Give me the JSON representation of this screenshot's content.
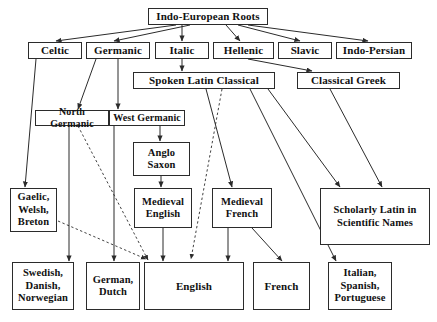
{
  "diagram": {
    "type": "flow-tree",
    "colors": {
      "stroke": "#2b2b2b",
      "text": "#111111",
      "background": "#ffffff"
    },
    "nodes": [
      {
        "id": "indo_european_roots",
        "label": "Indo-European Roots",
        "x": 148,
        "y": 8,
        "w": 120,
        "h": 17,
        "font": "f11"
      },
      {
        "id": "celtic",
        "label": "Celtic",
        "x": 28,
        "y": 42,
        "w": 54,
        "h": 17,
        "font": "f11"
      },
      {
        "id": "germanic",
        "label": "Germanic",
        "x": 86,
        "y": 42,
        "w": 64,
        "h": 17,
        "font": "f11"
      },
      {
        "id": "italic",
        "label": "Italic",
        "x": 155,
        "y": 42,
        "w": 54,
        "h": 17,
        "font": "f11"
      },
      {
        "id": "hellenic",
        "label": "Hellenic",
        "x": 213,
        "y": 42,
        "w": 61,
        "h": 17,
        "font": "f11"
      },
      {
        "id": "slavic",
        "label": "Slavic",
        "x": 278,
        "y": 42,
        "w": 54,
        "h": 17,
        "font": "f11"
      },
      {
        "id": "indo_persian",
        "label": "Indo-Persian",
        "x": 336,
        "y": 42,
        "w": 76,
        "h": 17,
        "font": "f11"
      },
      {
        "id": "spoken_latin",
        "label": "Spoken Latin Classical",
        "x": 133,
        "y": 72,
        "w": 142,
        "h": 17,
        "font": "f11"
      },
      {
        "id": "classical_greek",
        "label": "Classical Greek",
        "x": 297,
        "y": 72,
        "w": 103,
        "h": 17,
        "font": "f11"
      },
      {
        "id": "north_germanic",
        "label": "North Germanic",
        "x": 35,
        "y": 110,
        "w": 74,
        "h": 16,
        "font": "f10"
      },
      {
        "id": "west_germanic",
        "label": "West Germanic",
        "x": 109,
        "y": 110,
        "w": 76,
        "h": 16,
        "font": "f10"
      },
      {
        "id": "anglo_saxon",
        "label": "Anglo\nSaxon",
        "x": 133,
        "y": 142,
        "w": 57,
        "h": 34,
        "font": "f105"
      },
      {
        "id": "gaelic_welsh_breton",
        "label": "Gaelic,\nWelsh,\nBreton",
        "x": 10,
        "y": 188,
        "w": 47,
        "h": 44,
        "font": "f105"
      },
      {
        "id": "medieval_english",
        "label": "Medieval\nEnglish",
        "x": 134,
        "y": 188,
        "w": 58,
        "h": 40,
        "font": "f105"
      },
      {
        "id": "medieval_french",
        "label": "Medieval\nFrench",
        "x": 212,
        "y": 188,
        "w": 60,
        "h": 40,
        "font": "f105"
      },
      {
        "id": "scholarly_latin",
        "label": "Scholarly Latin in\nScientific Names",
        "x": 320,
        "y": 188,
        "w": 110,
        "h": 57,
        "font": "f105",
        "thick": true
      },
      {
        "id": "swedish_danish_norwegian",
        "label": "Swedish,\nDanish,\nNorwegian",
        "x": 12,
        "y": 262,
        "w": 62,
        "h": 48,
        "font": "f105"
      },
      {
        "id": "german_dutch",
        "label": "German,\nDutch",
        "x": 86,
        "y": 262,
        "w": 54,
        "h": 48,
        "font": "f105"
      },
      {
        "id": "english",
        "label": "English",
        "x": 144,
        "y": 262,
        "w": 100,
        "h": 48,
        "font": "f11"
      },
      {
        "id": "french",
        "label": "French",
        "x": 253,
        "y": 262,
        "w": 57,
        "h": 48,
        "font": "f11"
      },
      {
        "id": "italian_spanish_portuguese",
        "label": "Italian,\nSpanish,\nPortuguese",
        "x": 328,
        "y": 262,
        "w": 64,
        "h": 48,
        "font": "f105"
      }
    ],
    "edges": [
      {
        "from": "indo_european_roots",
        "to": "celtic",
        "style": "solid",
        "x1": 176,
        "y1": 25,
        "x2": 56,
        "y2": 41
      },
      {
        "from": "indo_european_roots",
        "to": "germanic",
        "style": "solid",
        "x1": 190,
        "y1": 25,
        "x2": 114,
        "y2": 41
      },
      {
        "from": "indo_european_roots",
        "to": "italic",
        "style": "solid",
        "x1": 182,
        "y1": 25,
        "x2": 182,
        "y2": 41
      },
      {
        "from": "indo_european_roots",
        "to": "hellenic",
        "style": "solid",
        "x1": 226,
        "y1": 25,
        "x2": 240,
        "y2": 41
      },
      {
        "from": "indo_european_roots",
        "to": "slavic",
        "style": "solid",
        "x1": 238,
        "y1": 25,
        "x2": 300,
        "y2": 41
      },
      {
        "from": "indo_european_roots",
        "to": "indo_persian",
        "style": "solid",
        "x1": 248,
        "y1": 25,
        "x2": 368,
        "y2": 41
      },
      {
        "from": "italic",
        "to": "spoken_latin",
        "style": "solid",
        "x1": 182,
        "y1": 59,
        "x2": 182,
        "y2": 71
      },
      {
        "from": "hellenic",
        "to": "classical_greek",
        "style": "solid",
        "x1": 248,
        "y1": 59,
        "x2": 312,
        "y2": 71
      },
      {
        "from": "celtic",
        "to": "gaelic_welsh_breton",
        "style": "solid",
        "x1": 36,
        "y1": 59,
        "x2": 25,
        "y2": 187
      },
      {
        "from": "germanic",
        "to": "north_germanic",
        "style": "solid",
        "x1": 96,
        "y1": 59,
        "x2": 78,
        "y2": 109
      },
      {
        "from": "germanic",
        "to": "west_germanic",
        "style": "solid",
        "x1": 118,
        "y1": 59,
        "x2": 118,
        "y2": 109
      },
      {
        "from": "north_germanic",
        "to": "swedish_danish_norwegian",
        "style": "solid",
        "x1": 69,
        "y1": 126,
        "x2": 69,
        "y2": 261
      },
      {
        "from": "north_germanic",
        "to": "english",
        "style": "dashed",
        "x1": 78,
        "y1": 126,
        "x2": 148,
        "y2": 260
      },
      {
        "from": "west_germanic",
        "to": "anglo_saxon",
        "style": "solid",
        "x1": 160,
        "y1": 126,
        "x2": 160,
        "y2": 141
      },
      {
        "from": "west_germanic",
        "to": "german_dutch",
        "style": "solid",
        "x1": 114,
        "y1": 126,
        "x2": 114,
        "y2": 261
      },
      {
        "from": "anglo_saxon",
        "to": "medieval_english",
        "style": "solid",
        "x1": 161,
        "y1": 176,
        "x2": 161,
        "y2": 187
      },
      {
        "from": "medieval_english",
        "to": "english",
        "style": "solid",
        "x1": 163,
        "y1": 228,
        "x2": 163,
        "y2": 261
      },
      {
        "from": "gaelic_welsh_breton",
        "to": "english",
        "style": "dashed",
        "x1": 58,
        "y1": 221,
        "x2": 146,
        "y2": 259
      },
      {
        "from": "spoken_latin",
        "to": "medieval_french",
        "style": "solid",
        "x1": 206,
        "y1": 89,
        "x2": 232,
        "y2": 187
      },
      {
        "from": "spoken_latin",
        "to": "english",
        "style": "dashed",
        "x1": 222,
        "y1": 89,
        "x2": 191,
        "y2": 259
      },
      {
        "from": "spoken_latin",
        "to": "italian_spanish_portuguese",
        "style": "solid",
        "x1": 250,
        "y1": 89,
        "x2": 336,
        "y2": 261
      },
      {
        "from": "spoken_latin",
        "to": "scholarly_latin",
        "style": "solid",
        "x1": 268,
        "y1": 89,
        "x2": 340,
        "y2": 187
      },
      {
        "from": "classical_greek",
        "to": "scholarly_latin",
        "style": "solid",
        "x1": 330,
        "y1": 89,
        "x2": 382,
        "y2": 187
      },
      {
        "from": "medieval_french",
        "to": "english",
        "style": "solid",
        "x1": 228,
        "y1": 228,
        "x2": 228,
        "y2": 261
      },
      {
        "from": "medieval_french",
        "to": "french",
        "style": "solid",
        "x1": 252,
        "y1": 228,
        "x2": 282,
        "y2": 261
      }
    ]
  }
}
